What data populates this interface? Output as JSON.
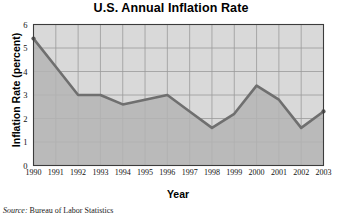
{
  "chart_data": {
    "type": "line",
    "title": "U.S. Annual Inflation Rate",
    "xlabel": "Year",
    "ylabel": "Inflation Rate (percent)",
    "categories": [
      "1990",
      "1991",
      "1992",
      "1993",
      "1994",
      "1995",
      "1996",
      "1997",
      "1998",
      "1999",
      "2000",
      "2001",
      "2002",
      "2003"
    ],
    "values": [
      5.4,
      4.2,
      3.0,
      3.0,
      2.6,
      2.8,
      3.0,
      2.3,
      1.6,
      2.2,
      3.4,
      2.8,
      1.6,
      2.3
    ],
    "ylim": [
      0,
      6
    ],
    "yticks": [
      0,
      1,
      2,
      3,
      4,
      5,
      6
    ],
    "grid": true,
    "legend": "none",
    "series_fill": true,
    "colors": {
      "line": "#6f6f6f",
      "fill": "#b4b4b4",
      "plot_background": "#d9d9d9",
      "grid": "#9a9a9a",
      "axis": "#3c3c3c",
      "text": "#000000"
    }
  },
  "figure": {
    "title": "U.S. Annual Inflation Rate",
    "axis_x_label": "Year",
    "axis_y_label": "Inflation Rate (percent)",
    "source_prefix": "Source:",
    "source_text": "Bureau of Labor Statistics"
  }
}
